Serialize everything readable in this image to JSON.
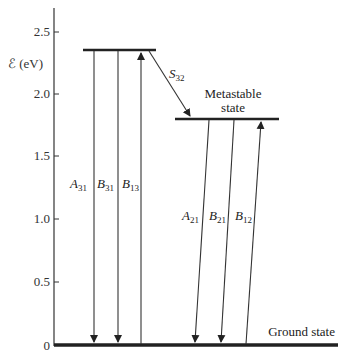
{
  "axis": {
    "label": "ℰ (eV)",
    "ticks": [
      {
        "value": "2.5",
        "y": 32
      },
      {
        "value": "2.0",
        "y": 94
      },
      {
        "value": "1.5",
        "y": 156
      },
      {
        "value": "1.0",
        "y": 219
      },
      {
        "value": "0.5",
        "y": 282
      },
      {
        "value": "0",
        "y": 345
      }
    ]
  },
  "levels": {
    "upper": {
      "energy_eV": 2.35
    },
    "metastable": {
      "energy_eV": 1.8,
      "label_line1": "Metastable",
      "label_line2": "state"
    },
    "ground": {
      "energy_eV": 0,
      "label": "Ground state"
    }
  },
  "transitions": {
    "A31": {
      "main": "A",
      "sub": "31"
    },
    "B31": {
      "main": "B",
      "sub": "31"
    },
    "B13": {
      "main": "B",
      "sub": "13"
    },
    "S32": {
      "main": "S",
      "sub": "32"
    },
    "A21": {
      "main": "A",
      "sub": "21"
    },
    "B21": {
      "main": "B",
      "sub": "21"
    },
    "B12": {
      "main": "B",
      "sub": "12"
    }
  }
}
